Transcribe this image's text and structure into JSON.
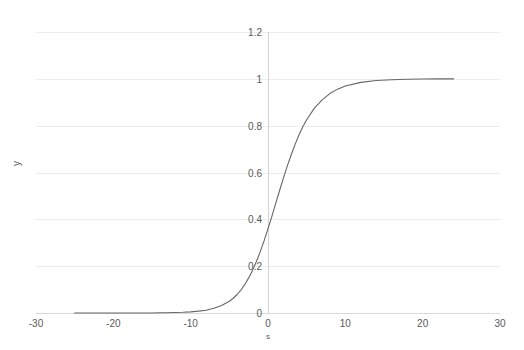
{
  "chart_data": {
    "type": "line",
    "title": "",
    "xlabel": "s",
    "ylabel": "y",
    "xlim": [
      -30,
      30
    ],
    "ylim": [
      0,
      1.2
    ],
    "grid": true,
    "legend": false,
    "legend_position": "none",
    "x_ticks": [
      "-30",
      "-20",
      "-10",
      "0",
      "10",
      "20",
      "30"
    ],
    "x_tick_values": [
      -30,
      -20,
      -10,
      0,
      10,
      20,
      30
    ],
    "y_ticks": [
      "0",
      "0.2",
      "0.4",
      "0.6",
      "0.8",
      "1",
      "1.2"
    ],
    "y_tick_values": [
      0,
      0.2,
      0.4,
      0.6,
      0.8,
      1,
      1.2
    ],
    "series": [
      {
        "name": "y",
        "color": "#666666",
        "x_range": [
          -25,
          24
        ],
        "function": "logistic",
        "x": [
          -25,
          -24,
          -23,
          -22,
          -21,
          -20,
          -19,
          -18,
          -17,
          -16,
          -15,
          -14,
          -13,
          -12,
          -11,
          -10,
          -9,
          -8,
          -7,
          -6,
          -5,
          -4.5,
          -4,
          -3.5,
          -3,
          -2.5,
          -2,
          -1.5,
          -1,
          -0.5,
          0,
          0.5,
          1,
          1.5,
          2,
          2.5,
          3,
          3.5,
          4,
          4.5,
          5,
          6,
          7,
          8,
          9,
          10,
          12,
          14,
          16,
          18,
          20,
          22,
          24
        ],
        "values": [
          0.0,
          0.0,
          0.0,
          0.0,
          0.0,
          0.0,
          0.0,
          0.0,
          0.0,
          0.0,
          0.0,
          0.001,
          0.001,
          0.002,
          0.003,
          0.005,
          0.008,
          0.012,
          0.02,
          0.032,
          0.05,
          0.063,
          0.079,
          0.098,
          0.122,
          0.15,
          0.182,
          0.22,
          0.262,
          0.309,
          0.36,
          0.413,
          0.468,
          0.523,
          0.577,
          0.628,
          0.676,
          0.72,
          0.76,
          0.795,
          0.825,
          0.875,
          0.91,
          0.937,
          0.956,
          0.969,
          0.985,
          0.993,
          0.996,
          0.998,
          0.999,
          1.0,
          1.0
        ]
      }
    ]
  },
  "axes": {
    "y_title": "y",
    "x_title": "s"
  },
  "colors": {
    "series": "#666666",
    "gridline": "#ededf0",
    "baseline": "#d9d9dd",
    "axis": "#d4d4d8",
    "tick_text": "#595959",
    "background": "#ffffff"
  }
}
